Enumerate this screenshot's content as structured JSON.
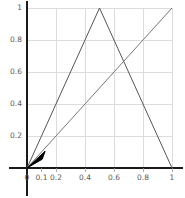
{
  "chart_data": {
    "type": "line",
    "title": "",
    "subtitle": "",
    "xlabel": "",
    "ylabel": "",
    "xlim": [
      0,
      1
    ],
    "ylim": [
      0,
      1
    ],
    "grid": true,
    "legend": "none",
    "x_ticks": [
      {
        "value": 0,
        "label": "0"
      },
      {
        "value": 0.1,
        "label": "0.1"
      },
      {
        "value": 0.2,
        "label": "0.2"
      },
      {
        "value": 0.4,
        "label": "0.4"
      },
      {
        "value": 0.6,
        "label": "0.6"
      },
      {
        "value": 0.8,
        "label": "0.8"
      },
      {
        "value": 1,
        "label": "1"
      }
    ],
    "y_ticks": [
      {
        "value": 0,
        "label": "0"
      },
      {
        "value": 0.2,
        "label": "0.2"
      },
      {
        "value": 0.4,
        "label": "0.4"
      },
      {
        "value": 0.6,
        "label": "0.6"
      },
      {
        "value": 0.8,
        "label": "0.8"
      },
      {
        "value": 1,
        "label": "1"
      }
    ],
    "gridlines_x": [
      0.2,
      0.4,
      0.6,
      0.8,
      1
    ],
    "gridlines_y": [
      0.2,
      0.4,
      0.6,
      0.8,
      1
    ],
    "series": [
      {
        "name": "tent-map",
        "type": "line",
        "color": "#555555",
        "width": 1,
        "points": [
          [
            0,
            0
          ],
          [
            0.5,
            1
          ],
          [
            1,
            0
          ]
        ]
      },
      {
        "name": "identity-line",
        "type": "line",
        "color": "#777777",
        "width": 1,
        "points": [
          [
            0,
            0
          ],
          [
            1,
            1
          ]
        ]
      },
      {
        "name": "cobweb-wedge",
        "type": "filled-polygon",
        "color": "#000000",
        "width": 1,
        "points": [
          [
            0,
            0
          ],
          [
            0.125,
            0.105
          ],
          [
            0.105,
            0.055
          ]
        ]
      }
    ],
    "axis_color": "#1a1a1a",
    "grid_color": "#dcdcdc",
    "background": "#ffffff",
    "tick_label_color": "#5a5a5a"
  }
}
